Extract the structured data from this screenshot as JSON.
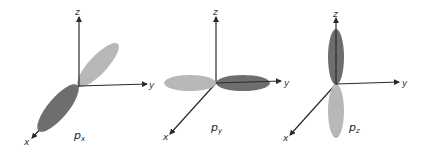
{
  "colors": {
    "dark_lobe": "#6e6e6e",
    "light_lobe": "#b8b8b8",
    "axis": "#2a2a2a"
  },
  "panels": [
    {
      "id": "px",
      "title_main": "p",
      "title_sub": "x",
      "axes": {
        "x": "x",
        "y": "y",
        "z": "z"
      }
    },
    {
      "id": "py",
      "title_main": "p",
      "title_sub": "y",
      "axes": {
        "x": "x",
        "y": "y",
        "z": "z",
        "y_neg": "y"
      }
    },
    {
      "id": "pz",
      "title_main": "p",
      "title_sub": "z",
      "axes": {
        "x": "x",
        "y": "y",
        "z": "z"
      }
    }
  ]
}
